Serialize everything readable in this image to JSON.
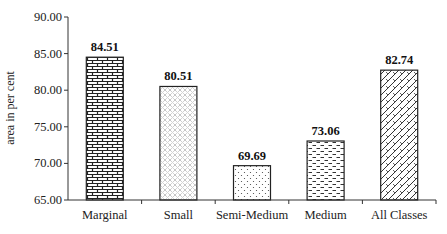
{
  "chart_data": {
    "type": "bar",
    "title": "",
    "xlabel": "",
    "ylabel": "area in per cent",
    "ylim": [
      65.0,
      90.0
    ],
    "yticks": [
      "65.00",
      "70.00",
      "75.00",
      "80.00",
      "85.00",
      "90.00"
    ],
    "grid": false,
    "legend": null,
    "categories": [
      "Marginal",
      "Small",
      "Semi-Medium",
      "Medium",
      "All Classes"
    ],
    "values": [
      84.51,
      80.51,
      69.69,
      73.06,
      82.74
    ],
    "value_labels": [
      "84.51",
      "80.51",
      "69.69",
      "73.06",
      "82.74"
    ],
    "patterns": [
      "brick",
      "diamond-dots",
      "dots",
      "dashes",
      "diagonal-brick"
    ]
  }
}
